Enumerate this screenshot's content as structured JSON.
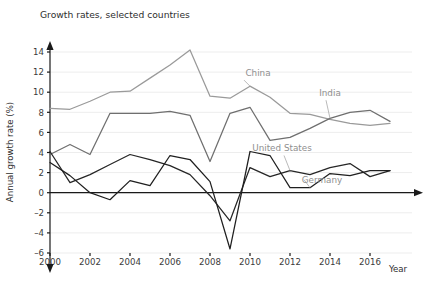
{
  "chart_data": {
    "type": "line",
    "title": "Growth rates, selected countries",
    "xlabel": "Year",
    "ylabel": "Annual growth rate (%)",
    "xlim": [
      2000,
      2017
    ],
    "ylim": [
      -6,
      15
    ],
    "yticks": [
      -6,
      -4,
      -2,
      0,
      2,
      4,
      6,
      8,
      10,
      12,
      14
    ],
    "ytick_labels": [
      "–6",
      "–4",
      "–2",
      "0",
      "2",
      "4",
      "6",
      "8",
      "10",
      "12",
      "14"
    ],
    "xticks": [
      2000,
      2002,
      2004,
      2006,
      2008,
      2010,
      2012,
      2014,
      2016
    ],
    "xtick_labels": [
      "2000",
      "2002",
      "2004",
      "2006",
      "2008",
      "2010",
      "2012",
      "2014",
      "2016"
    ],
    "grid": true,
    "grid_axis": "y",
    "legend_position": "inline-annotations",
    "x": [
      2000,
      2001,
      2002,
      2003,
      2004,
      2005,
      2006,
      2007,
      2008,
      2009,
      2010,
      2011,
      2012,
      2013,
      2014,
      2015,
      2016,
      2017
    ],
    "series": [
      {
        "name": "China",
        "color": "#9a9a9a",
        "label_x": 2010.4,
        "label_y": 11.6,
        "values": [
          8.4,
          8.3,
          9.1,
          10.0,
          10.1,
          11.4,
          12.7,
          14.2,
          9.6,
          9.4,
          10.6,
          9.5,
          7.9,
          7.8,
          7.3,
          6.9,
          6.7,
          6.9
        ]
      },
      {
        "name": "India",
        "color": "#6f6f6f",
        "label_x": 2014.0,
        "label_y": 9.6,
        "values": [
          3.8,
          4.8,
          3.8,
          7.9,
          7.9,
          7.9,
          8.1,
          7.7,
          3.1,
          7.9,
          8.5,
          5.2,
          5.5,
          6.4,
          7.4,
          8.0,
          8.2,
          7.1
        ]
      },
      {
        "name": "United States",
        "color": "#262626",
        "label_x": 2011.6,
        "label_y": 4.1,
        "values": [
          4.1,
          1.0,
          1.8,
          2.8,
          3.8,
          3.3,
          2.7,
          1.8,
          -0.3,
          -2.8,
          2.5,
          1.6,
          2.2,
          1.8,
          2.5,
          2.9,
          1.6,
          2.2
        ]
      },
      {
        "name": "Germany",
        "color": "#1f1f1f",
        "label_x": 2013.6,
        "label_y": 1.0,
        "values": [
          3.0,
          1.7,
          0.0,
          -0.7,
          1.2,
          0.7,
          3.7,
          3.3,
          1.1,
          -5.6,
          4.1,
          3.7,
          0.5,
          0.5,
          1.9,
          1.7,
          2.2,
          2.2
        ]
      }
    ]
  }
}
